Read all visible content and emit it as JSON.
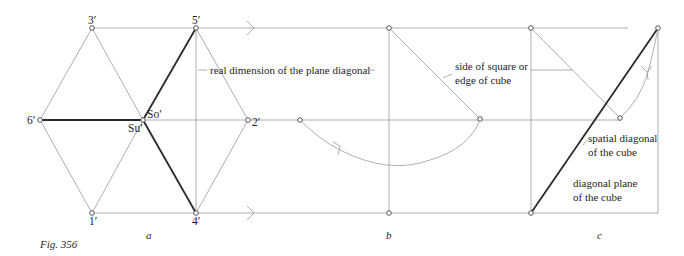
{
  "figure": {
    "caption": "Fig. 356",
    "panels": [
      {
        "id": "a",
        "label": "a"
      },
      {
        "id": "b",
        "label": "b"
      },
      {
        "id": "c",
        "label": "c"
      }
    ]
  },
  "points": {
    "p1": "1′",
    "p2": "2′",
    "p3": "3′",
    "p4": "4′",
    "p5": "5′",
    "p6": "6′",
    "so": "So′",
    "su": "Su′"
  },
  "annotations": {
    "plane_diagonal": "real dimension of the plane diagonal",
    "side_line1": "side of square or",
    "side_line2": "edge of cube",
    "spatial_line1": "spatial diagonal",
    "spatial_line2": "of the cube",
    "plane_line1": "diagonal plane",
    "plane_line2": "of the cube"
  },
  "colors": {
    "thin_line": "#9a9a9a",
    "thick_line": "#2a2a2a",
    "text": "#1e1e1e"
  }
}
